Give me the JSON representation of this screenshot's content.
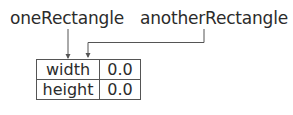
{
  "variables": [
    {
      "name": "oneRectangle"
    },
    {
      "name": "anotherRectangle"
    }
  ],
  "object": {
    "rows": [
      {
        "field": "width",
        "value": "0.0"
      },
      {
        "field": "height",
        "value": "0.0"
      }
    ]
  },
  "colors": {
    "line": "#555555",
    "text": "#2b2b2b",
    "background": "#ffffff"
  }
}
